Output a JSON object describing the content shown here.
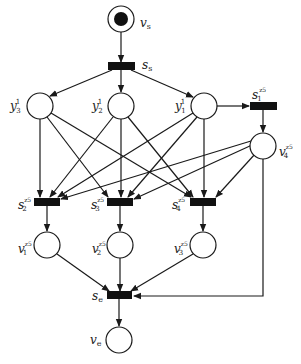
{
  "diagram": {
    "type": "petri-net",
    "colors": {
      "stroke": "#1a1a1a",
      "fill": "#ffffff",
      "transition": "#111111",
      "token": "#111111"
    },
    "places": [
      {
        "id": "vs",
        "label": "v",
        "sub": "s",
        "sup": "",
        "marked": true
      },
      {
        "id": "y3",
        "label": "y",
        "sub": "3",
        "sup": "1"
      },
      {
        "id": "y2",
        "label": "y",
        "sub": "2",
        "sup": "1"
      },
      {
        "id": "y1",
        "label": "y",
        "sub": "1",
        "sup": "1"
      },
      {
        "id": "v4",
        "label": "v",
        "sub": "4",
        "sup": "z5"
      },
      {
        "id": "v1",
        "label": "v",
        "sub": "1",
        "sup": "z5"
      },
      {
        "id": "v2",
        "label": "v",
        "sub": "2",
        "sup": "z5"
      },
      {
        "id": "v3",
        "label": "v",
        "sub": "3",
        "sup": "z5"
      },
      {
        "id": "ve",
        "label": "v",
        "sub": "e",
        "sup": ""
      }
    ],
    "transitions": [
      {
        "id": "ss",
        "label": "s",
        "sub": "s",
        "sup": ""
      },
      {
        "id": "s1",
        "label": "s",
        "sub": "1",
        "sup": "z5"
      },
      {
        "id": "s2",
        "label": "s",
        "sub": "2",
        "sup": "z5"
      },
      {
        "id": "s3",
        "label": "s",
        "sub": "3",
        "sup": "z5"
      },
      {
        "id": "s4",
        "label": "s",
        "sub": "4",
        "sup": "z5"
      },
      {
        "id": "se",
        "label": "s",
        "sub": "e",
        "sup": ""
      }
    ],
    "arcs": [
      [
        "vs",
        "ss"
      ],
      [
        "ss",
        "y3"
      ],
      [
        "ss",
        "y2"
      ],
      [
        "ss",
        "y1"
      ],
      [
        "y1",
        "s1"
      ],
      [
        "s1",
        "v4"
      ],
      [
        "y3",
        "s2"
      ],
      [
        "y3",
        "s3"
      ],
      [
        "y3",
        "s4"
      ],
      [
        "y2",
        "s2"
      ],
      [
        "y2",
        "s3"
      ],
      [
        "y2",
        "s4"
      ],
      [
        "y1",
        "s2"
      ],
      [
        "y1",
        "s3"
      ],
      [
        "y1",
        "s4"
      ],
      [
        "v4",
        "s2"
      ],
      [
        "v4",
        "s3"
      ],
      [
        "v4",
        "s4"
      ],
      [
        "s2",
        "v1"
      ],
      [
        "s3",
        "v2"
      ],
      [
        "s4",
        "v3"
      ],
      [
        "v1",
        "se"
      ],
      [
        "v2",
        "se"
      ],
      [
        "v3",
        "se"
      ],
      [
        "v4",
        "se"
      ],
      [
        "se",
        "ve"
      ]
    ]
  }
}
